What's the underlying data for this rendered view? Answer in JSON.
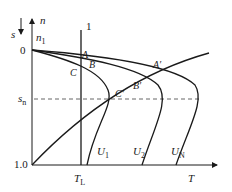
{
  "diagram": {
    "type": "motor-speed-torque characteristics under varying stator voltage",
    "colors": {
      "stroke": "#1a1a1a",
      "background": "#ffffff",
      "dashed": "#555555"
    },
    "axes": {
      "vertical_label_n": "n",
      "vertical_label_s": "s",
      "n1_label": "n",
      "n1_sub": "1",
      "origin_label": "0",
      "sn_label": "s",
      "sn_sub": "n",
      "one_label": "1.0",
      "horizontal_label": "T",
      "tl_label": "T",
      "tl_sub": "L"
    },
    "load_line_label": "1",
    "points": {
      "A": "A",
      "B": "B",
      "C": "C",
      "A_prime": "A′",
      "B_prime": "B′",
      "C_prime": "C′"
    },
    "curves": [
      {
        "label": "U",
        "sub": "1"
      },
      {
        "label": "U",
        "sub": "2"
      },
      {
        "label": "U",
        "sub": "N"
      }
    ]
  }
}
